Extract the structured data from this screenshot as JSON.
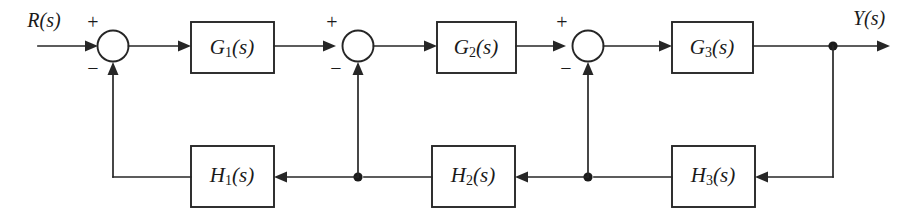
{
  "diagram": {
    "type": "control-system-block-diagram",
    "canvas": {
      "width": 923,
      "height": 213
    },
    "colors": {
      "background": "#ffffff",
      "line": "#262626",
      "text": "#1a1a1a",
      "node": "#1a1a1a"
    },
    "signals": {
      "input": {
        "label": "R(s)",
        "name": "reference-input"
      },
      "output": {
        "label": "Y(s)",
        "name": "output-signal"
      }
    },
    "forward_blocks": [
      {
        "id": "G1",
        "base": "G",
        "sub": "1",
        "arg": "(s)",
        "label": "G1(s)"
      },
      {
        "id": "G2",
        "base": "G",
        "sub": "2",
        "arg": "(s)",
        "label": "G2(s)"
      },
      {
        "id": "G3",
        "base": "G",
        "sub": "3",
        "arg": "(s)",
        "label": "G3(s)"
      }
    ],
    "feedback_blocks": [
      {
        "id": "H1",
        "base": "H",
        "sub": "1",
        "arg": "(s)",
        "label": "H1(s)"
      },
      {
        "id": "H2",
        "base": "H",
        "sub": "2",
        "arg": "(s)",
        "label": "H2(s)"
      },
      {
        "id": "H3",
        "base": "H",
        "sub": "3",
        "arg": "(s)",
        "label": "H3(s)"
      }
    ],
    "summing_junctions": [
      {
        "id": "S1",
        "plus": "+",
        "minus": "−",
        "plus_side": "top-left",
        "minus_side": "bottom-left"
      },
      {
        "id": "S2",
        "plus": "+",
        "minus": "−",
        "plus_side": "top-left",
        "minus_side": "bottom-left"
      },
      {
        "id": "S3",
        "plus": "+",
        "minus": "−",
        "plus_side": "top-left",
        "minus_side": "bottom-left"
      }
    ],
    "loops": [
      {
        "from": "output-node",
        "through": "H3",
        "to": "S3",
        "sign": "−"
      },
      {
        "from": "H2-branch-node",
        "through": "H2",
        "to": "S2",
        "sign": "−"
      },
      {
        "from": "H1-branch-node",
        "through": "H1",
        "to": "S1",
        "sign": "−"
      }
    ]
  }
}
